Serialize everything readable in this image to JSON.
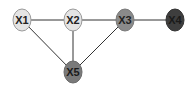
{
  "diagram": {
    "type": "undirected-graph",
    "nodes": [
      {
        "id": "X1",
        "label": "X1",
        "cx": 22,
        "cy": 20,
        "fill": "#e4e4e4",
        "text": "#222222"
      },
      {
        "id": "X2",
        "label": "X2",
        "cx": 73,
        "cy": 20,
        "fill": "#e4e4e4",
        "text": "#222222"
      },
      {
        "id": "X3",
        "label": "X3",
        "cx": 125,
        "cy": 20,
        "fill": "#8a8a8a",
        "text": "#222222"
      },
      {
        "id": "X4",
        "label": "X4",
        "cx": 175,
        "cy": 20,
        "fill": "#3e3e3e",
        "text": "#1a1a1a"
      },
      {
        "id": "X5",
        "label": "X5",
        "cx": 73,
        "cy": 72,
        "fill": "#7a7a7a",
        "text": "#1a1a1a"
      }
    ],
    "edges": [
      {
        "from": "X1",
        "to": "X2"
      },
      {
        "from": "X2",
        "to": "X3"
      },
      {
        "from": "X3",
        "to": "X4"
      },
      {
        "from": "X1",
        "to": "X5"
      },
      {
        "from": "X2",
        "to": "X5"
      },
      {
        "from": "X3",
        "to": "X5"
      }
    ],
    "edge_color": "#333333",
    "node_stroke": "#9a9a9a"
  }
}
